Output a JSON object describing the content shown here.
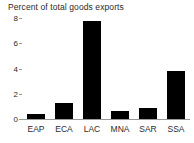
{
  "chart_data": {
    "type": "bar",
    "title": "Percent of total goods exports",
    "xlabel": "",
    "ylabel": "",
    "categories": [
      "EAP",
      "ECA",
      "LAC",
      "MNA",
      "SAR",
      "SSA"
    ],
    "values": [
      0.4,
      1.3,
      7.8,
      0.6,
      0.9,
      3.8
    ],
    "ylim": [
      0,
      8
    ],
    "yticks": [
      0,
      2,
      4,
      6,
      8
    ],
    "ytick_labels": [
      "0",
      "2",
      "4",
      "6",
      "8"
    ],
    "grid": false,
    "legend": null,
    "bar_color": "#000000",
    "axis_color": "#9a9a9a",
    "text_color": "#2b2b2b"
  }
}
